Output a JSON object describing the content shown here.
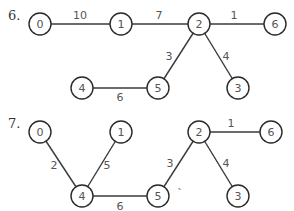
{
  "graphs": [
    {
      "label": "6.",
      "label_pos": [
        8,
        20
      ],
      "nodes": [
        {
          "id": "0",
          "x": 40,
          "y": 24
        },
        {
          "id": "1",
          "x": 121,
          "y": 24
        },
        {
          "id": "2",
          "x": 199,
          "y": 24
        },
        {
          "id": "6",
          "x": 275,
          "y": 24
        },
        {
          "id": "4",
          "x": 82,
          "y": 88
        },
        {
          "id": "5",
          "x": 158,
          "y": 88
        },
        {
          "id": "3",
          "x": 238,
          "y": 88
        }
      ],
      "edges": [
        {
          "from": "0",
          "to": "1",
          "weight": "10",
          "lx": 80,
          "ly": 15
        },
        {
          "from": "1",
          "to": "2",
          "weight": "7",
          "lx": 159,
          "ly": 15
        },
        {
          "from": "2",
          "to": "6",
          "weight": "1",
          "lx": 234,
          "ly": 15
        },
        {
          "from": "2",
          "to": "5",
          "weight": "3",
          "lx": 169,
          "ly": 56
        },
        {
          "from": "2",
          "to": "3",
          "weight": "4",
          "lx": 226,
          "ly": 56
        },
        {
          "from": "4",
          "to": "5",
          "weight": "6",
          "lx": 120,
          "ly": 97
        }
      ]
    },
    {
      "label": "7.",
      "label_pos": [
        8,
        128
      ],
      "nodes": [
        {
          "id": "0",
          "x": 40,
          "y": 132
        },
        {
          "id": "1",
          "x": 121,
          "y": 132
        },
        {
          "id": "2",
          "x": 199,
          "y": 132
        },
        {
          "id": "6",
          "x": 271,
          "y": 132
        },
        {
          "id": "4",
          "x": 82,
          "y": 196
        },
        {
          "id": "5",
          "x": 158,
          "y": 196
        },
        {
          "id": "3",
          "x": 238,
          "y": 196
        }
      ],
      "edges": [
        {
          "from": "0",
          "to": "4",
          "weight": "2",
          "lx": 54,
          "ly": 165
        },
        {
          "from": "1",
          "to": "4",
          "weight": "5",
          "lx": 107,
          "ly": 165
        },
        {
          "from": "2",
          "to": "6",
          "weight": "1",
          "lx": 231,
          "ly": 123
        },
        {
          "from": "2",
          "to": "5",
          "weight": "3",
          "lx": 170,
          "ly": 163
        },
        {
          "from": "2",
          "to": "3",
          "weight": "4",
          "lx": 226,
          "ly": 163
        },
        {
          "from": "4",
          "to": "5",
          "weight": "6",
          "lx": 120,
          "ly": 206
        }
      ],
      "stray_mark": {
        "text": "`",
        "x": 180,
        "y": 193
      }
    }
  ]
}
